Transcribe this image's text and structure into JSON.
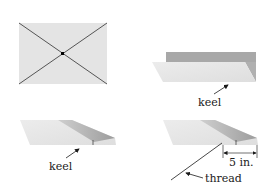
{
  "figure": {
    "panels": [
      {
        "id": "flat-sheet",
        "description": "rectangle with diagonals crossing at center point"
      },
      {
        "id": "folded-keel",
        "label": "keel"
      },
      {
        "id": "side-view-keel",
        "label": "keel"
      },
      {
        "id": "thread-attachment",
        "labels": {
          "thread": "thread",
          "measure": "5 in."
        }
      }
    ],
    "colors": {
      "paper_light": "#e6e6e6",
      "paper_mid": "#d4d4d4",
      "fold_dark": "#a8a8a8",
      "line": "#4a4a4a",
      "text": "#1a1a1a"
    }
  }
}
